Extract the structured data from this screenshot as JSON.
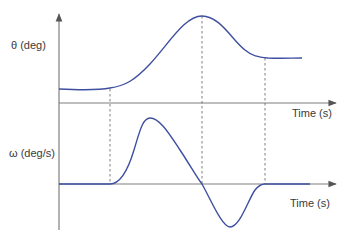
{
  "diagram": {
    "type": "timing-diagram",
    "colors": {
      "curve": "#3f4fa0",
      "axis": "#7f7f7f",
      "guide": "#6f6f6f",
      "text": "#3a3a3a"
    },
    "top_plot": {
      "y_label": "θ (deg)",
      "x_label": "Time (s)",
      "curve": "angle vs time: flat, rises to a peak, then settles to a higher constant"
    },
    "bottom_plot": {
      "y_label": "ω (deg/s)",
      "x_label": "Time (s)",
      "curve": "angular velocity vs time: zero, positive pulse, negative pulse, back to zero"
    },
    "guides": [
      {
        "name": "motion-start",
        "description": "θ begins rising; ω leaves zero"
      },
      {
        "name": "theta-peak",
        "description": "θ at maximum; ω crosses zero"
      },
      {
        "name": "motion-end",
        "description": "θ settles; ω returns to zero"
      }
    ]
  }
}
